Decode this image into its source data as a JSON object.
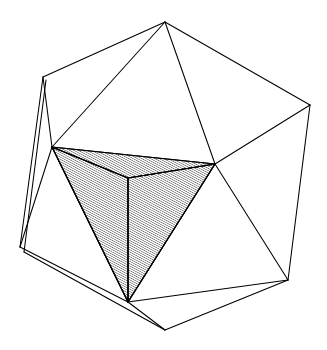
{
  "figure": {
    "caption": "",
    "background_color": "#ffffff",
    "line_color": "#000000",
    "hatch_color": "#1a1a1a",
    "canvas": {
      "width": 327,
      "height": 350
    },
    "outer_solid": {
      "name": "icosahedron-wireframe",
      "style": "outline",
      "fill": "none",
      "stroke_width": 1.05,
      "vertices": [
        {
          "id": "T",
          "label": "top-apex",
          "x": 165,
          "y": 22
        },
        {
          "id": "UL",
          "label": "upper-left",
          "x": 43,
          "y": 77
        },
        {
          "id": "UR",
          "label": "upper-right",
          "x": 310,
          "y": 105
        },
        {
          "id": "ML",
          "label": "mid-left",
          "x": 52,
          "y": 147
        },
        {
          "id": "MR",
          "label": "mid-right",
          "x": 215,
          "y": 164
        },
        {
          "id": "LL",
          "label": "lower-left",
          "x": 20,
          "y": 247
        },
        {
          "id": "LR",
          "label": "lower-right",
          "x": 288,
          "y": 280
        },
        {
          "id": "BC",
          "label": "bottom-center",
          "x": 165,
          "y": 330
        },
        {
          "id": "BA",
          "label": "bottom-apex-inner",
          "x": 128,
          "y": 302
        },
        {
          "id": "LL2",
          "label": "lower-left-back",
          "x": 24,
          "y": 252
        },
        {
          "id": "UL2",
          "label": "upper-left-back",
          "x": 46,
          "y": 80
        }
      ],
      "edges": [
        {
          "from": "T",
          "to": "UL"
        },
        {
          "from": "T",
          "to": "UR"
        },
        {
          "from": "T",
          "to": "ML"
        },
        {
          "from": "T",
          "to": "MR"
        },
        {
          "from": "UL",
          "to": "ML"
        },
        {
          "from": "UL2",
          "to": "LL2"
        },
        {
          "from": "UL",
          "to": "LL"
        },
        {
          "from": "UR",
          "to": "MR"
        },
        {
          "from": "UR",
          "to": "LR"
        },
        {
          "from": "ML",
          "to": "LL"
        },
        {
          "from": "ML",
          "to": "BA"
        },
        {
          "from": "MR",
          "to": "BA"
        },
        {
          "from": "MR",
          "to": "LR"
        },
        {
          "from": "LL",
          "to": "BA"
        },
        {
          "from": "LL2",
          "to": "BC"
        },
        {
          "from": "BA",
          "to": "BC"
        },
        {
          "from": "BA",
          "to": "LR"
        },
        {
          "from": "BC",
          "to": "LR"
        }
      ]
    },
    "inner_solid": {
      "name": "inscribed-tetrahedron",
      "style": "hatched",
      "hatch_angle_deg": 62,
      "hatch_spacing_px": 2,
      "stroke_width": 1.15,
      "vertices": [
        {
          "id": "A",
          "label": "tetra-left",
          "x": 52,
          "y": 147
        },
        {
          "id": "B",
          "label": "tetra-right",
          "x": 215,
          "y": 164
        },
        {
          "id": "C",
          "label": "tetra-back",
          "x": 128,
          "y": 178
        },
        {
          "id": "D",
          "label": "tetra-bottom",
          "x": 128,
          "y": 302
        }
      ],
      "faces": [
        {
          "id": "F1",
          "label": "front-left-face",
          "verts": [
            "A",
            "C",
            "D"
          ],
          "shade": "light"
        },
        {
          "id": "F2",
          "label": "front-right-face",
          "verts": [
            "C",
            "B",
            "D"
          ],
          "shade": "light"
        },
        {
          "id": "F3",
          "label": "top-sliver-face",
          "verts": [
            "A",
            "B",
            "C"
          ],
          "shade": "light"
        }
      ],
      "edges": [
        {
          "from": "A",
          "to": "B",
          "kind": "silhouette"
        },
        {
          "from": "A",
          "to": "C",
          "kind": "interior"
        },
        {
          "from": "B",
          "to": "C",
          "kind": "interior"
        },
        {
          "from": "A",
          "to": "D",
          "kind": "silhouette"
        },
        {
          "from": "B",
          "to": "D",
          "kind": "silhouette"
        },
        {
          "from": "C",
          "to": "D",
          "kind": "interior"
        }
      ]
    }
  }
}
